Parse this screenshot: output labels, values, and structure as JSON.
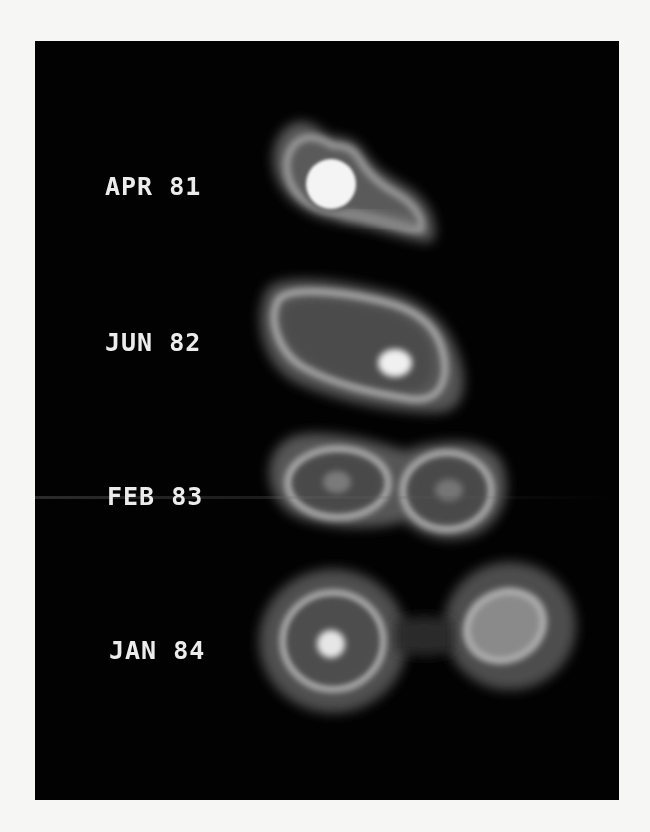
{
  "figure": {
    "background": "#020202",
    "frame_background": "#f6f6f4",
    "epochs": [
      {
        "label": "APR 81",
        "morphology": "bright compact core with faint extension to lower right"
      },
      {
        "label": "JUN 82",
        "morphology": "elongated source with bright knot at lower right"
      },
      {
        "label": "FEB 83",
        "morphology": "two lobes joined in figure-eight shape"
      },
      {
        "label": "JAN 84",
        "morphology": "two separated components"
      }
    ]
  }
}
